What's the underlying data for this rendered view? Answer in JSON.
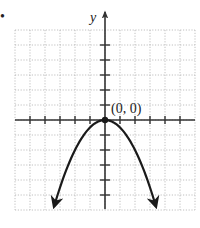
{
  "problem_bullet": "•",
  "chart_data": {
    "type": "line",
    "title": "",
    "xlabel": "",
    "ylabel": "y",
    "function": "y = -0.5x^2",
    "xlim": [
      -6,
      6
    ],
    "ylim": [
      -6,
      6
    ],
    "grid": true,
    "grid_style": "dotted",
    "x_ticks": [
      -5,
      -4,
      -3,
      -2,
      -1,
      1,
      2,
      3,
      4,
      5
    ],
    "y_ticks": [
      -5,
      -4,
      -3,
      -2,
      -1,
      1,
      2,
      3,
      4,
      5
    ],
    "series": [
      {
        "name": "parabola",
        "x": [
          -3.4,
          -3,
          -2,
          -1,
          0,
          1,
          2,
          3,
          3.4
        ],
        "y": [
          -5.78,
          -4.5,
          -2,
          -0.5,
          0,
          -0.5,
          -2,
          -4.5,
          -5.78
        ],
        "arrows_at_ends": true
      }
    ],
    "points": [
      {
        "x": 0,
        "y": 0,
        "label": "(0, 0)"
      }
    ],
    "annotations": [
      {
        "text": "(0, 0)",
        "at": [
          0,
          0
        ]
      }
    ],
    "colors": {
      "curve": "#1a1a1a",
      "axes": "#333333",
      "grid": "#b0b0b0"
    }
  }
}
